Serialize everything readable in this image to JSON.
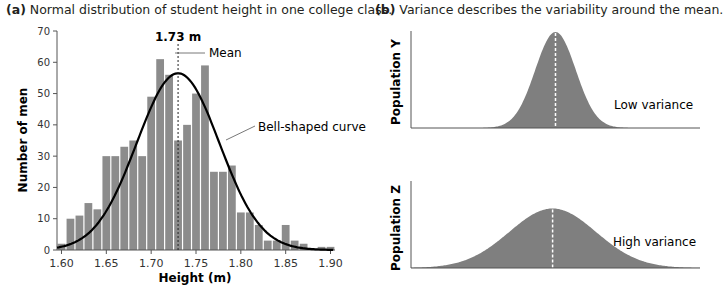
{
  "panel_a": {
    "letter": "(a)",
    "title": "Normal distribution of student height in one college class.",
    "mean_label": "1.73 m",
    "mean_annotation": "Mean",
    "curve_annotation": "Bell-shaped curve"
  },
  "panel_b": {
    "letter": "(b)",
    "title": "Variance describes the variability around the mean.",
    "top": {
      "ylabel": "Population Y",
      "label": "Low variance"
    },
    "bottom": {
      "ylabel": "Population Z",
      "label": "High variance"
    }
  },
  "colors": {
    "bar": "#8c8c8c",
    "curve": "#000000",
    "fill": "#7f7f7f",
    "axis": "#555555"
  },
  "chart_data": [
    {
      "type": "bar",
      "title": "(a) Normal distribution of student height in one college class.",
      "xlabel": "Height (m)",
      "ylabel": "Number of men",
      "xlim": [
        1.595,
        1.905
      ],
      "ylim": [
        0,
        70
      ],
      "yticks": [
        0,
        10,
        20,
        30,
        40,
        50,
        60,
        70
      ],
      "xticks": [
        "1.60",
        "1.65",
        "1.70",
        "1.75",
        "1.80",
        "1.85",
        "1.90"
      ],
      "bin_width": 0.01,
      "bin_start": 1.6,
      "values": [
        2,
        10,
        11,
        15,
        13,
        30,
        30,
        33,
        35,
        30,
        49,
        61,
        56,
        35,
        40,
        50,
        59,
        25,
        25,
        27,
        12,
        12,
        8,
        3,
        3,
        8,
        3,
        2,
        0,
        1,
        1
      ],
      "overlay": {
        "type": "line",
        "name": "Bell-shaped curve",
        "mean": 1.73,
        "sd": 0.046,
        "peak": 56.5
      },
      "annotations": [
        "1.73 m",
        "Mean",
        "Bell-shaped curve"
      ],
      "grid": false
    },
    {
      "type": "area",
      "title": "(b) Variance describes the variability around the mean.",
      "series": [
        {
          "name": "Population Y",
          "label": "Low variance",
          "mean": 0.5,
          "sd": 0.07,
          "relative_peak": 1.0
        },
        {
          "name": "Population Z",
          "label": "High variance",
          "mean": 0.49,
          "sd": 0.15,
          "relative_peak": 0.62
        }
      ],
      "grid": false
    }
  ]
}
